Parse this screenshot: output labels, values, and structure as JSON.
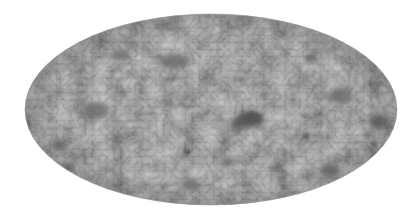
{
  "image": {
    "description": "Grayscale full-sky map in Mollweide (elliptical) projection showing mottled anisotropy texture",
    "projection": "mollweide",
    "background": "#ffffff",
    "ellipse": {
      "cx": 211,
      "cy": 109.5,
      "rx": 186,
      "ry": 95.5
    },
    "colors": {
      "base": "#8b8b8b",
      "light": "#ababab",
      "dark": "#5e5e5e",
      "darkest": "#3c3c3c"
    },
    "features": [
      {
        "name": "dark-blob-center",
        "cx": 250,
        "cy": 119,
        "rx": 13,
        "ry": 8,
        "color": "#4a4a4a"
      },
      {
        "name": "dark-blob-center-b",
        "cx": 238,
        "cy": 124,
        "rx": 8,
        "ry": 6,
        "color": "#5a5a5a"
      },
      {
        "name": "dark-spot-right",
        "cx": 306,
        "cy": 136,
        "rx": 3.5,
        "ry": 3.5,
        "color": "#333333"
      },
      {
        "name": "dark-patch-far-right",
        "cx": 378,
        "cy": 122,
        "rx": 8,
        "ry": 7,
        "color": "#5c5c5c"
      },
      {
        "name": "dark-patch-upper-right",
        "cx": 311,
        "cy": 58,
        "rx": 6,
        "ry": 4,
        "color": "#626262"
      },
      {
        "name": "dark-patch-lower-left",
        "cx": 68,
        "cy": 168,
        "rx": 6,
        "ry": 4,
        "color": "#5e5e5e"
      },
      {
        "name": "dark-patch-left",
        "cx": 60,
        "cy": 145,
        "rx": 7,
        "ry": 5,
        "color": "#666666"
      },
      {
        "name": "dark-patch-lower-center",
        "cx": 228,
        "cy": 162,
        "rx": 6,
        "ry": 5,
        "color": "#676767"
      },
      {
        "name": "dark-patch-mid-left",
        "cx": 95,
        "cy": 110,
        "rx": 12,
        "ry": 8,
        "color": "#6e6e6e"
      },
      {
        "name": "dark-patch-upper-center",
        "cx": 175,
        "cy": 62,
        "rx": 14,
        "ry": 7,
        "color": "#707070"
      },
      {
        "name": "dark-patch-upper-left",
        "cx": 120,
        "cy": 55,
        "rx": 10,
        "ry": 6,
        "color": "#727272"
      },
      {
        "name": "dark-patch-right-mid",
        "cx": 340,
        "cy": 95,
        "rx": 10,
        "ry": 8,
        "color": "#6c6c6c"
      },
      {
        "name": "dark-patch-lower-right",
        "cx": 330,
        "cy": 170,
        "rx": 9,
        "ry": 6,
        "color": "#6a6a6a"
      },
      {
        "name": "dark-patch-bottom",
        "cx": 190,
        "cy": 185,
        "rx": 10,
        "ry": 5,
        "color": "#707070"
      }
    ]
  }
}
